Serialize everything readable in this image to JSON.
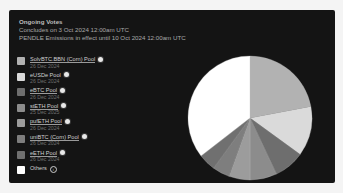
{
  "header": {
    "title": "Ongoing Votes",
    "concludes": "Concludes on 3 Oct 2024 12:00am UTC",
    "emissions": "PENDLE Emissions in effect until 10 Oct 2024 12:00am UTC"
  },
  "legend": [
    {
      "name": "SolvBTC.BBN (Corn) Pool",
      "date": "26 Dec 2024",
      "color": "#b2b2b2",
      "icon": "token-badge-icon"
    },
    {
      "name": "eUSDe Pool",
      "date": "26 Dec 2024",
      "color": "#dadada",
      "icon": "token-badge-icon"
    },
    {
      "name": "eBTC Pool",
      "date": "26 Dec 2024",
      "color": "#6e6e6e",
      "icon": "token-badge-icon"
    },
    {
      "name": "stETH Pool",
      "date": "25 Dec 2025",
      "color": "#8c8c8c",
      "icon": "token-badge-icon"
    },
    {
      "name": "pufETH Pool",
      "date": "26 Dec 2024",
      "color": "#9c9c9c",
      "icon": "token-badge-icon"
    },
    {
      "name": "uniBTC (Corn) Pool",
      "date": "26 Dec 2024",
      "color": "#7e7e7e",
      "icon": "token-badge-icon"
    },
    {
      "name": "eETH Pool",
      "date": "26 Dec 2024",
      "color": "#707070",
      "icon": "token-badge-icon"
    },
    {
      "name": "Others",
      "date": "",
      "color": "#ffffff",
      "icon": "info-icon"
    }
  ],
  "chart_data": {
    "type": "pie",
    "title": "Ongoing Votes",
    "categories": [
      "SolvBTC.BBN (Corn) Pool",
      "eUSDe Pool",
      "eBTC Pool",
      "stETH Pool",
      "pufETH Pool",
      "uniBTC (Corn) Pool",
      "eETH Pool",
      "Others"
    ],
    "values": [
      22,
      13,
      8,
      7,
      5.5,
      4.5,
      4.5,
      35.5
    ],
    "colors": [
      "#b2b2b2",
      "#dadada",
      "#6e6e6e",
      "#8c8c8c",
      "#9c9c9c",
      "#7e7e7e",
      "#707070",
      "#ffffff"
    ],
    "start_angle": "12 o'clock, clockwise",
    "legend_position": "left"
  }
}
